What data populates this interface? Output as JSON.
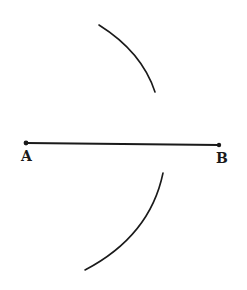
{
  "diagram": {
    "type": "geometric-construction",
    "points": {
      "A": {
        "label": "A",
        "x": 26,
        "y": 143
      },
      "B": {
        "label": "B",
        "x": 219,
        "y": 145
      }
    },
    "segment": {
      "from": "A",
      "to": "B"
    },
    "arcs": [
      {
        "name": "upper-arc",
        "start": [
          99,
          25
        ],
        "control": [
          142,
          52
        ],
        "end": [
          155,
          92
        ]
      },
      {
        "name": "lower-arc",
        "start": [
          163,
          173
        ],
        "control": [
          150,
          236
        ],
        "end": [
          85,
          270
        ]
      }
    ],
    "colors": {
      "stroke": "#1a1a1a",
      "background": "#ffffff"
    }
  }
}
